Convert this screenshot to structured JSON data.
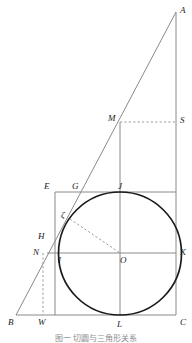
{
  "figure": {
    "caption": "图一 切圆与三角形关系",
    "colors": {
      "thin_line": "#8a8a8a",
      "circle_line": "#1a1a1a",
      "dashed_line": "#9a9a9a",
      "label_text": "#1a1a1a",
      "background": "#ffffff"
    },
    "points": [
      {
        "id": "A",
        "label": "A",
        "x": 176,
        "y": 12,
        "lx": 180,
        "ly": 6
      },
      {
        "id": "S",
        "label": "S",
        "x": 176,
        "y": 122,
        "lx": 180,
        "ly": 116
      },
      {
        "id": "M",
        "label": "M",
        "x": 120,
        "y": 122,
        "lx": 108,
        "ly": 114
      },
      {
        "id": "E",
        "label": "E",
        "x": 55,
        "y": 192,
        "lx": 44,
        "ly": 182
      },
      {
        "id": "G",
        "label": "G",
        "x": 77,
        "y": 192,
        "lx": 72,
        "ly": 182
      },
      {
        "id": "J",
        "label": "J",
        "x": 120,
        "y": 192,
        "lx": 118,
        "ly": 182
      },
      {
        "id": "Z",
        "label": "ζ",
        "x": 70,
        "y": 219,
        "lx": 61,
        "ly": 211
      },
      {
        "id": "H",
        "label": "H",
        "x": 55,
        "y": 238,
        "lx": 38,
        "ly": 232
      },
      {
        "id": "N",
        "label": "N",
        "x": 50,
        "y": 253,
        "lx": 33,
        "ly": 248
      },
      {
        "id": "I",
        "label": "I",
        "x": 61,
        "y": 253,
        "lx": 58,
        "ly": 256
      },
      {
        "id": "O",
        "label": "O",
        "x": 120,
        "y": 253,
        "lx": 120,
        "ly": 256
      },
      {
        "id": "K",
        "label": "K",
        "x": 176,
        "y": 253,
        "lx": 180,
        "ly": 248
      },
      {
        "id": "B",
        "label": "B",
        "x": 16,
        "y": 315,
        "lx": 8,
        "ly": 318
      },
      {
        "id": "W",
        "label": "W",
        "x": 43,
        "y": 315,
        "lx": 38,
        "ly": 318
      },
      {
        "id": "L",
        "label": "L",
        "x": 120,
        "y": 315,
        "lx": 117,
        "ly": 320
      },
      {
        "id": "C",
        "label": "C",
        "x": 176,
        "y": 315,
        "lx": 180,
        "ly": 318
      }
    ],
    "circle": {
      "name": "inscribed-circle",
      "cx": 120,
      "cy": 253.5,
      "r": 61.5
    },
    "solid_segments": [
      {
        "name": "segment-B-A",
        "x1": 16,
        "y1": 315,
        "x2": 176,
        "y2": 12
      },
      {
        "name": "segment-A-C",
        "x1": 176,
        "y1": 12,
        "x2": 176,
        "y2": 315
      },
      {
        "name": "segment-B-C",
        "x1": 16,
        "y1": 315,
        "x2": 176,
        "y2": 315
      },
      {
        "name": "segment-E-K",
        "x1": 55,
        "y1": 192,
        "x2": 176,
        "y2": 192
      },
      {
        "name": "segment-N-K",
        "x1": 47,
        "y1": 253,
        "x2": 176,
        "y2": 253
      },
      {
        "name": "segment-E-W",
        "x1": 55,
        "y1": 192,
        "x2": 55,
        "y2": 315
      },
      {
        "name": "segment-M-L",
        "x1": 120,
        "y1": 122,
        "x2": 120,
        "y2": 315
      }
    ],
    "dashed_segments": [
      {
        "name": "segment-M-S",
        "x1": 120,
        "y1": 122,
        "x2": 176,
        "y2": 122
      },
      {
        "name": "segment-zeta-O",
        "x1": 70,
        "y1": 219,
        "x2": 120,
        "y2": 253
      },
      {
        "name": "segment-W-vertical",
        "x1": 43,
        "y1": 253,
        "x2": 43,
        "y2": 315
      }
    ]
  }
}
